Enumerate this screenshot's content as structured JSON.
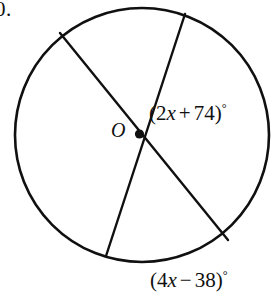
{
  "figure": {
    "problem_number": "0.",
    "center_label": "O",
    "background_color": "#ffffff",
    "stroke_color": "#101010",
    "circle": {
      "cx": 142,
      "cy": 135,
      "r": 127
    },
    "center_point": {
      "x": 139,
      "y": 134,
      "marker": "filled-dot"
    },
    "chords": [
      {
        "name": "chord-upper-left-to-lower-right",
        "x1": 60,
        "y1": 33,
        "x2": 228,
        "y2": 240
      },
      {
        "name": "chord-upper-right-to-lower-left",
        "x1": 185,
        "y1": 14,
        "x2": 106,
        "y2": 256
      }
    ]
  },
  "labels": {
    "angle_top": {
      "open": "(",
      "coefficient": "2",
      "variable": "x",
      "operator": "+",
      "constant": "74",
      "close": ")",
      "degree": "°",
      "full_text": "(2x + 74)°"
    },
    "angle_bottom": {
      "open": "(",
      "coefficient": "4",
      "variable": "x",
      "operator": "−",
      "constant": "38",
      "close": ")",
      "degree": "°",
      "full_text": "(4x − 38)°"
    }
  }
}
